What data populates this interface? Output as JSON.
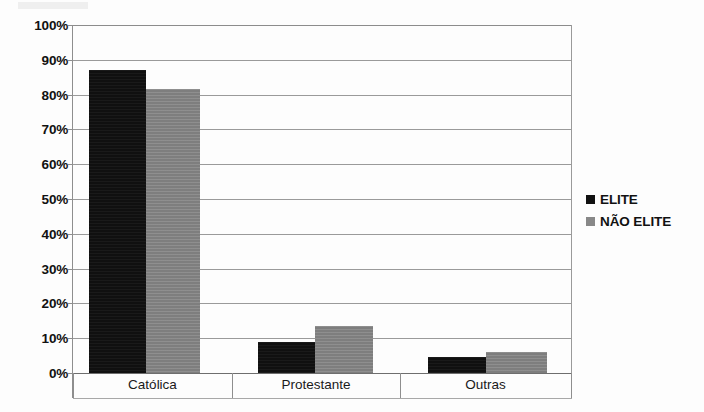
{
  "chart_data": {
    "type": "bar",
    "title": "",
    "subtitle": "",
    "xlabel": "",
    "ylabel": "",
    "categories": [
      "Católica",
      "Protestante",
      "Outras"
    ],
    "series": [
      {
        "name": "ELITE",
        "color": "#101010",
        "values": [
          87,
          9,
          4.5
        ]
      },
      {
        "name": "NÃO ELITE",
        "color": "#828282",
        "values": [
          81.5,
          13.5,
          6
        ]
      }
    ],
    "ylim": [
      0,
      100
    ],
    "y_ticks": [
      "0%",
      "10%",
      "20%",
      "30%",
      "40%",
      "50%",
      "60%",
      "70%",
      "80%",
      "90%",
      "100%"
    ],
    "y_tick_values": [
      0,
      10,
      20,
      30,
      40,
      50,
      60,
      70,
      80,
      90,
      100
    ],
    "grid": true,
    "grid_axis": "y",
    "legend_position": "right",
    "value_format": "percent"
  },
  "legend": {
    "items": [
      {
        "label": "ELITE",
        "color": "#101010"
      },
      {
        "label": "NÃO ELITE",
        "color": "#828282"
      }
    ]
  },
  "axis": {
    "x_categories": [
      "Católica",
      "Protestante",
      "Outras"
    ]
  }
}
